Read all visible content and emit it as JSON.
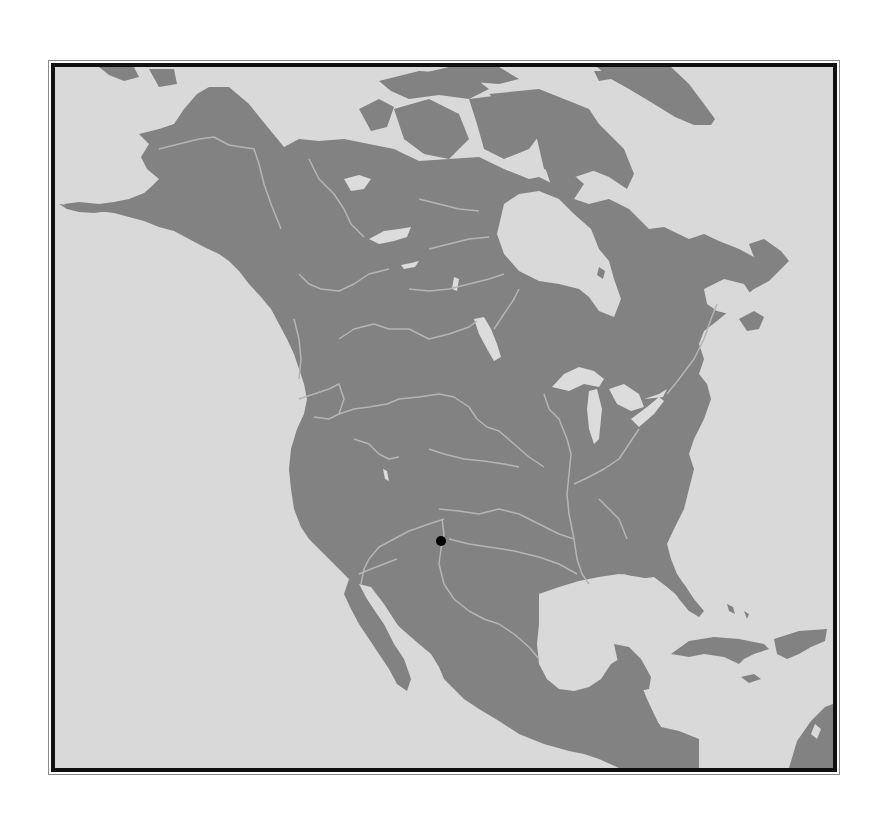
{
  "map": {
    "type": "locator-map",
    "region": "North America",
    "colors": {
      "water": "#d9d9d9",
      "land": "#828282",
      "rivers": "#b8b8b8",
      "lakes": "#dcdcdc",
      "marker": "#000000",
      "frame": "#111111",
      "frame_outer": "#8a8a8a"
    },
    "marker": {
      "shape": "filled-circle",
      "x": 442,
      "y": 542,
      "diameter": 10
    }
  }
}
